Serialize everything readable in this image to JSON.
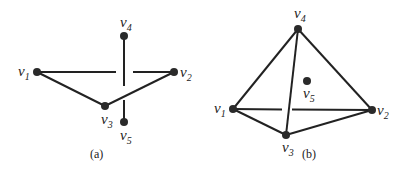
{
  "figure_a": {
    "caption": "(a)",
    "vertices": [
      {
        "id": "v1",
        "label": "v",
        "sub": "1"
      },
      {
        "id": "v2",
        "label": "v",
        "sub": "2"
      },
      {
        "id": "v3",
        "label": "v",
        "sub": "3"
      },
      {
        "id": "v4",
        "label": "v",
        "sub": "4"
      },
      {
        "id": "v5",
        "label": "v",
        "sub": "5"
      }
    ],
    "edges": [
      [
        "v1",
        "v2"
      ],
      [
        "v1",
        "v3"
      ],
      [
        "v2",
        "v3"
      ],
      [
        "v4",
        "v5"
      ]
    ]
  },
  "figure_b": {
    "caption": "(b)",
    "vertices": [
      {
        "id": "v1",
        "label": "v",
        "sub": "1"
      },
      {
        "id": "v2",
        "label": "v",
        "sub": "2"
      },
      {
        "id": "v3",
        "label": "v",
        "sub": "3"
      },
      {
        "id": "v4",
        "label": "v",
        "sub": "4"
      },
      {
        "id": "v5",
        "label": "v",
        "sub": "5"
      }
    ],
    "edges": [
      [
        "v1",
        "v2"
      ],
      [
        "v1",
        "v3"
      ],
      [
        "v2",
        "v3"
      ],
      [
        "v1",
        "v4"
      ],
      [
        "v2",
        "v4"
      ],
      [
        "v3",
        "v4"
      ]
    ]
  }
}
